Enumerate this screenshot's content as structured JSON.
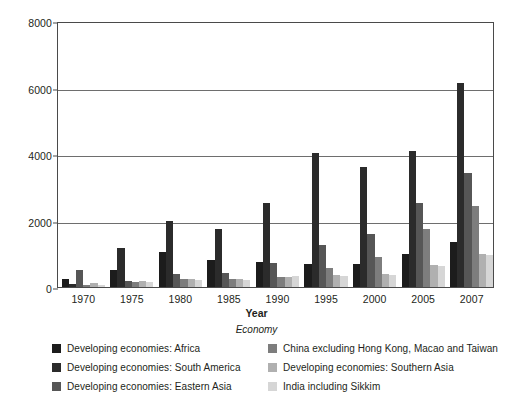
{
  "chart_data": {
    "type": "bar",
    "title": "",
    "subtitle": "",
    "xlabel": "Year",
    "ylabel": "",
    "caption": "Economy",
    "categories": [
      "1970",
      "1975",
      "1980",
      "1985",
      "1990",
      "1995",
      "2000",
      "2005",
      "2007"
    ],
    "ylim": [
      0,
      8000
    ],
    "yticks": [
      0,
      2000,
      4000,
      6000,
      8000
    ],
    "ytick_labels": [
      "0",
      "2000",
      "4000",
      "6000",
      "8000"
    ],
    "grid": "horizontal",
    "legend_position": "bottom",
    "series": [
      {
        "name": "Developing economies: Africa",
        "color": "#1c1c1c",
        "values": [
          240,
          520,
          1060,
          810,
          760,
          690,
          700,
          990,
          1360
        ]
      },
      {
        "name": "Developing economies: South America",
        "color": "#2b2b2b",
        "values": [
          100,
          1170,
          1980,
          1740,
          2530,
          4030,
          3610,
          4090,
          6140
        ]
      },
      {
        "name": "Developing economies: Eastern Asia",
        "color": "#565656",
        "values": [
          520,
          170,
          380,
          430,
          720,
          1250,
          1600,
          2540,
          3420
        ]
      },
      {
        "name": "China excluding Hong Kong, Macao and Taiwan",
        "color": "#7d7d7d",
        "values": [
          60,
          150,
          250,
          240,
          290,
          580,
          900,
          1740,
          2450
        ]
      },
      {
        "name": "Developing economies: Southern Asia",
        "color": "#b0b0b0",
        "values": [
          120,
          190,
          230,
          230,
          300,
          360,
          380,
          650,
          980
        ]
      },
      {
        "name": "India including Sikkim",
        "color": "#d6d6d6",
        "values": [
          60,
          160,
          220,
          220,
          340,
          340,
          360,
          630,
          950
        ]
      }
    ]
  },
  "axis": {
    "x_title": "Year",
    "caption": "Economy"
  },
  "legend": {
    "left_items": [
      {
        "label": "Developing economies: Africa",
        "color": "#1c1c1c"
      },
      {
        "label": "Developing economies: South America",
        "color": "#2b2b2b"
      },
      {
        "label": "Developing economies: Eastern Asia",
        "color": "#565656"
      }
    ],
    "right_items": [
      {
        "label": "China excluding Hong Kong, Macao and Taiwan",
        "color": "#7d7d7d"
      },
      {
        "label": "Developing economies: Southern Asia",
        "color": "#b0b0b0"
      },
      {
        "label": "India including Sikkim",
        "color": "#d6d6d6"
      }
    ]
  }
}
